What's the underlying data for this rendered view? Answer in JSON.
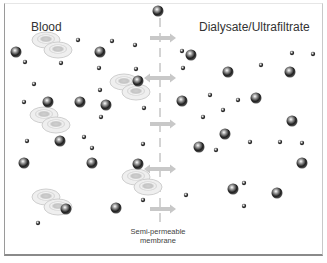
{
  "left_region": {
    "title": "Blood"
  },
  "right_region": {
    "title": "Dialysate/Ultrafiltrate"
  },
  "membrane": {
    "label_line1": "Semi-permeable",
    "label_line2": "membrane"
  },
  "arrows": [
    {
      "direction": "right"
    },
    {
      "direction": "both"
    },
    {
      "direction": "right"
    },
    {
      "direction": "both"
    },
    {
      "direction": "right"
    }
  ],
  "legend_items": {
    "red_blood_cell": "red-blood-cell",
    "large_solute": "large-molecule",
    "small_solute": "small-molecule"
  },
  "colors": {
    "arrow": "#c8c8c8",
    "membrane": "#a0a0a0",
    "particle_dark": "#2a2a2a",
    "rbc_rim": "#d8d8d8"
  }
}
